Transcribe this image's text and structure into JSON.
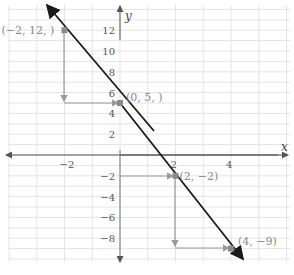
{
  "chart_data": {
    "type": "line",
    "title": "",
    "xlabel": "x",
    "ylabel": "y",
    "xlim": [
      -4,
      6
    ],
    "ylim": [
      -10,
      14
    ],
    "grid": true,
    "x_ticks": [
      -2,
      2,
      4
    ],
    "x_tick_labels": [
      "−2",
      "2",
      "4"
    ],
    "y_ticks": [
      12,
      10,
      8,
      6,
      4,
      2,
      -2,
      -4,
      -6,
      -8
    ],
    "y_tick_labels": [
      "12",
      "10",
      "8",
      "6",
      "4",
      "2",
      "−2",
      "−4",
      "−6",
      "−8"
    ],
    "series": [
      {
        "name": "line",
        "x": [
          -2,
          0,
          2,
          4
        ],
        "y": [
          12,
          5,
          -2,
          -9
        ],
        "color": "#1a1a1a"
      }
    ],
    "points": [
      {
        "x": -2,
        "y": 12,
        "label": "(−2, 12, )"
      },
      {
        "x": 0,
        "y": 5,
        "label": "(0, 5, )"
      },
      {
        "x": 2,
        "y": -2,
        "label": "(2, −2)"
      },
      {
        "x": 4,
        "y": -9,
        "label": "(4, −9)"
      }
    ],
    "annotations": [
      "Step arrows: from (−2,12) down to (−2,5) then right to (0,5)",
      "Step arrows: from (0,−2) right to (2,−2), then down to (2,−9) and right to (4,−9)"
    ]
  },
  "colors": {
    "line": "#1a1a1a",
    "grid": "#e4e4e4",
    "axis": "#555555",
    "step_arrows": "#9a9a9a",
    "point": "#8a8a8a"
  }
}
